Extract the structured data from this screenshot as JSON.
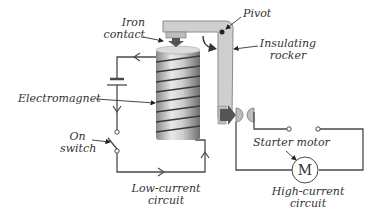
{
  "diagram": {
    "type": "starter-solenoid-relay",
    "labels": {
      "iron_contact": [
        "Iron",
        "contact"
      ],
      "pivot": "Pivot",
      "insulating_rocker": [
        "Insulating",
        "rocker"
      ],
      "electromagnet": "Electromagnet",
      "on_switch": [
        "On",
        "switch"
      ],
      "starter_motor": "Starter motor",
      "motor_symbol": "M",
      "low_current_circuit": [
        "Low-current",
        "circuit"
      ],
      "high_current_circuit": [
        "High-current",
        "circuit"
      ]
    },
    "colors": {
      "wire": "#4a4a4a",
      "rocker_fill": "#cfcfcf",
      "rocker_stroke": "#8a8a8a",
      "coil_light": "#e6e6e6",
      "coil_dark": "#7a7a7a",
      "winding": "#3a3a3a",
      "arrow": "#222222",
      "text": "#333333"
    }
  }
}
